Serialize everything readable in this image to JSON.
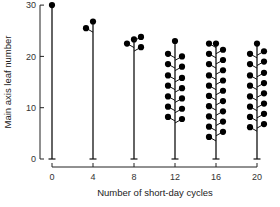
{
  "chart_data": {
    "type": "scatter",
    "title": "",
    "xlabel": "Number of short-day cycles",
    "ylabel": "Main axis leaf number",
    "x_ticks": [
      "0",
      "4",
      "8",
      "12",
      "16",
      "20"
    ],
    "y_ticks": [
      "0",
      "10",
      "20",
      "30"
    ],
    "ylim": [
      0,
      30
    ],
    "xlim": [
      0,
      20
    ],
    "grid": false,
    "legend": null,
    "plants": [
      {
        "cycles": 0,
        "stem_top": 30,
        "flowers": [
          {
            "side": "c",
            "y": 30
          }
        ]
      },
      {
        "cycles": 4,
        "stem_top": 26.5,
        "flowers": [
          {
            "side": "l",
            "y": 25.5
          },
          {
            "side": "c",
            "y": 26.8
          }
        ]
      },
      {
        "cycles": 8,
        "stem_top": 23,
        "flowers": [
          {
            "side": "l",
            "y": 22.5
          },
          {
            "side": "c",
            "y": 23.3
          },
          {
            "side": "r",
            "y": 23.8
          },
          {
            "side": "r",
            "y": 21.8
          }
        ]
      },
      {
        "cycles": 12,
        "stem_top": 23,
        "flowers": [
          {
            "side": "c",
            "y": 23
          },
          {
            "side": "l",
            "y": 20.5
          },
          {
            "side": "r",
            "y": 20
          },
          {
            "side": "l",
            "y": 18.5
          },
          {
            "side": "r",
            "y": 18
          },
          {
            "side": "l",
            "y": 16.3
          },
          {
            "side": "r",
            "y": 15.8
          },
          {
            "side": "l",
            "y": 14.3
          },
          {
            "side": "r",
            "y": 13.8
          },
          {
            "side": "l",
            "y": 12.2
          },
          {
            "side": "r",
            "y": 11.8
          },
          {
            "side": "l",
            "y": 10.2
          },
          {
            "side": "r",
            "y": 9.8
          },
          {
            "side": "l",
            "y": 8.2
          },
          {
            "side": "r",
            "y": 7.8
          }
        ]
      },
      {
        "cycles": 16,
        "stem_top": 22.5,
        "flowers": [
          {
            "side": "l",
            "y": 22.5
          },
          {
            "side": "c",
            "y": 22.5
          },
          {
            "side": "r",
            "y": 21.3
          },
          {
            "side": "l",
            "y": 20.5
          },
          {
            "side": "r",
            "y": 19.3
          },
          {
            "side": "l",
            "y": 18.5
          },
          {
            "side": "r",
            "y": 17.3
          },
          {
            "side": "l",
            "y": 16.3
          },
          {
            "side": "r",
            "y": 15.3
          },
          {
            "side": "l",
            "y": 14.3
          },
          {
            "side": "r",
            "y": 13.3
          },
          {
            "side": "l",
            "y": 12.3
          },
          {
            "side": "r",
            "y": 11.3
          },
          {
            "side": "l",
            "y": 10.3
          },
          {
            "side": "r",
            "y": 9.3
          },
          {
            "side": "l",
            "y": 8.3
          },
          {
            "side": "r",
            "y": 7.3
          },
          {
            "side": "l",
            "y": 6.3
          },
          {
            "side": "r",
            "y": 5.3
          },
          {
            "side": "l",
            "y": 4.3
          }
        ]
      },
      {
        "cycles": 20,
        "stem_top": 22.5,
        "flowers": [
          {
            "side": "c",
            "y": 22.5
          },
          {
            "side": "l",
            "y": 20.5
          },
          {
            "side": "r",
            "y": 21
          },
          {
            "side": "l",
            "y": 18.5
          },
          {
            "side": "r",
            "y": 19
          },
          {
            "side": "l",
            "y": 16.3
          },
          {
            "side": "r",
            "y": 16.8
          },
          {
            "side": "l",
            "y": 14.3
          },
          {
            "side": "r",
            "y": 14.8
          },
          {
            "side": "l",
            "y": 12.2
          },
          {
            "side": "r",
            "y": 12.8
          },
          {
            "side": "l",
            "y": 10.2
          },
          {
            "side": "r",
            "y": 10.8
          },
          {
            "side": "l",
            "y": 8.2
          },
          {
            "side": "r",
            "y": 8.8
          },
          {
            "side": "l",
            "y": 6.2
          },
          {
            "side": "r",
            "y": 6.8
          }
        ]
      }
    ]
  }
}
